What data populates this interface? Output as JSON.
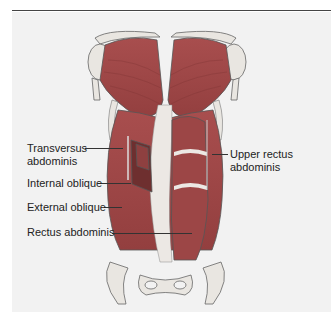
{
  "figure": {
    "colors": {
      "background": "#f2f2f2",
      "muscle": "#a34a4a",
      "muscle_dark": "#7e3434",
      "tendon": "#ece8e4",
      "bone": "#e9e6e1",
      "outline": "#555555"
    }
  },
  "labels": {
    "transversus_abdominis_1": "Transversus",
    "transversus_abdominis_2": "abdominis",
    "internal_oblique": "Internal oblique",
    "external_oblique": "External oblique",
    "rectus_abdominis": "Rectus abdominis",
    "upper_rectus_abdominis_1": "Upper rectus",
    "upper_rectus_abdominis_2": "abdominis"
  }
}
